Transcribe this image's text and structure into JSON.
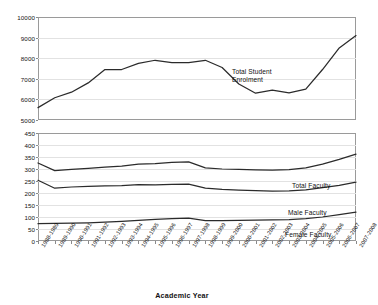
{
  "chart_data": {
    "type": "line",
    "title": "",
    "xlabel": "Academic Year",
    "ylabel": "",
    "grid": true,
    "legend_position": "inline-annotations",
    "broken_axis": true,
    "categories": [
      "1988-1989",
      "1989-1990",
      "1990-1991",
      "1991-1992",
      "1992-1993",
      "1993-1994",
      "1994-1995",
      "1995-1996",
      "1996-1997",
      "1997-1998",
      "1998-1999",
      "1999-2000",
      "2000-2001",
      "2001-2002",
      "2002-2003",
      "2003-2004",
      "2004-2005",
      "2005-2006",
      "2006-2007",
      "2007-2008"
    ],
    "panels": [
      {
        "name": "enrolment-panel",
        "ylim": [
          5000,
          10000
        ],
        "yticks": [
          5000,
          6000,
          7000,
          8000,
          9000,
          10000
        ],
        "series": [
          {
            "name": "Total Student Enrolment",
            "values": [
              5600,
              6080,
              6350,
              6800,
              7450,
              7450,
              7750,
              7900,
              7780,
              7780,
              7900,
              7550,
              6750,
              6300,
              6450,
              6320,
              6500,
              7450,
              8500,
              9100
            ]
          }
        ]
      },
      {
        "name": "faculty-panel",
        "ylim": [
          0,
          450
        ],
        "yticks": [
          0,
          50,
          100,
          150,
          200,
          250,
          300,
          350,
          400,
          450
        ],
        "series": [
          {
            "name": "Total Faculty",
            "values": [
              325,
              293,
              298,
              303,
              308,
              312,
              320,
              322,
              328,
              330,
              305,
              300,
              298,
              296,
              295,
              297,
              305,
              320,
              340,
              362
            ]
          },
          {
            "name": "Male Faculty",
            "values": [
              253,
              220,
              225,
              228,
              230,
              231,
              235,
              234,
              236,
              237,
              220,
              215,
              212,
              210,
              208,
              209,
              213,
              222,
              232,
              245
            ]
          },
          {
            "name": "Female Faculty",
            "values": [
              72,
              73,
              74,
              76,
              79,
              82,
              86,
              90,
              93,
              95,
              85,
              85,
              86,
              87,
              88,
              89,
              93,
              100,
              110,
              120
            ]
          }
        ]
      }
    ],
    "annotations": [
      {
        "label": "Total Student Enrolment",
        "line1": "Total Student",
        "line2": "Enrolment"
      },
      {
        "label": "Total Faculty",
        "line1": "Total Faculty",
        "line2": ""
      },
      {
        "label": "Male Faculty",
        "line1": "Male Faculty",
        "line2": ""
      },
      {
        "label": "Female Faculty",
        "line1": "Female Faculty",
        "line2": ""
      }
    ],
    "colors": {
      "line": "#2b2b2b",
      "grid": "#e2e2e2",
      "frame": "#9a9a9a",
      "background": "#ffffff"
    }
  }
}
